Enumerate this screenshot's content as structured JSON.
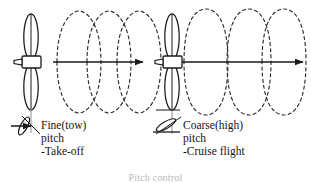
{
  "figure": {
    "caption": "Pitch control",
    "caption_visible": "partially-cropped-at-bottom-edge",
    "stroke_color": "#1a1a1a",
    "dash_color": "#2b2b2b",
    "background": "#ffffff"
  },
  "panels": [
    {
      "id": "fine-pitch",
      "side": "left",
      "label_lines": [
        "Fine(tow)",
        "pitch",
        "-Take-off"
      ],
      "line1": "Fine(tow)",
      "line2": "pitch",
      "line3": "-Take-off",
      "helix_loops": 3,
      "helix_loop_width_px": 30,
      "helix_amplitude_px": 44,
      "pitch_kind": "fine",
      "blade_angle_deg": 68,
      "axis_arrow_label": "direction-of-flight",
      "icon": "propeller-fine-pitch-icon"
    },
    {
      "id": "coarse-pitch",
      "side": "right",
      "label_lines": [
        "Coarse(high)",
        "pitch",
        "-Cruise flight"
      ],
      "line1": "Coarse(high)",
      "line2": "pitch",
      "line3": "-Cruise flight",
      "helix_loops": 3,
      "helix_loop_width_px": 44,
      "helix_amplitude_px": 48,
      "pitch_kind": "coarse",
      "blade_angle_deg": 32,
      "axis_arrow_label": "direction-of-flight",
      "icon": "propeller-coarse-pitch-icon"
    }
  ]
}
